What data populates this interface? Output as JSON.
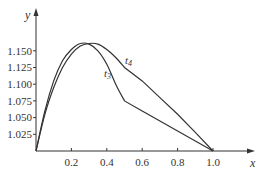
{
  "chart_data": {
    "type": "line",
    "title": "",
    "xlabel": "x",
    "ylabel": "y",
    "xlim": [
      0,
      1.0
    ],
    "ylim": [
      1.0,
      1.175
    ],
    "grid": false,
    "legend": "inline labels on curves",
    "x_ticks": [
      "0.2",
      "0.4",
      "0.6",
      "0.8",
      "1.0"
    ],
    "y_ticks": [
      "1.025",
      "1.050",
      "1.075",
      "1.100",
      "1.125",
      "1.150"
    ],
    "series": [
      {
        "name": "t3",
        "label_main": "t",
        "label_sub": "3",
        "points": [
          [
            0.0,
            1.0
          ],
          [
            0.05,
            1.06
          ],
          [
            0.1,
            1.105
          ],
          [
            0.15,
            1.135
          ],
          [
            0.2,
            1.152
          ],
          [
            0.25,
            1.161
          ],
          [
            0.3,
            1.16
          ],
          [
            0.35,
            1.15
          ],
          [
            0.4,
            1.13
          ],
          [
            0.45,
            1.1
          ],
          [
            0.5,
            1.075
          ],
          [
            0.6,
            1.06
          ],
          [
            0.7,
            1.045
          ],
          [
            0.8,
            1.03
          ],
          [
            0.9,
            1.015
          ],
          [
            1.0,
            1.0
          ]
        ]
      },
      {
        "name": "t4",
        "label_main": "t",
        "label_sub": "4",
        "points": [
          [
            0.0,
            1.0
          ],
          [
            0.05,
            1.055
          ],
          [
            0.1,
            1.095
          ],
          [
            0.15,
            1.125
          ],
          [
            0.2,
            1.145
          ],
          [
            0.25,
            1.157
          ],
          [
            0.3,
            1.161
          ],
          [
            0.35,
            1.16
          ],
          [
            0.4,
            1.152
          ],
          [
            0.45,
            1.14
          ],
          [
            0.5,
            1.125
          ],
          [
            0.6,
            1.105
          ],
          [
            0.7,
            1.08
          ],
          [
            0.8,
            1.055
          ],
          [
            0.9,
            1.028
          ],
          [
            1.0,
            1.0
          ]
        ]
      }
    ]
  }
}
